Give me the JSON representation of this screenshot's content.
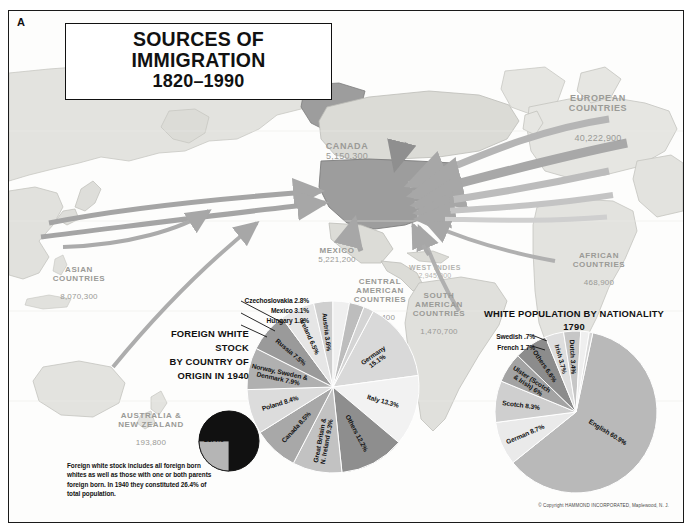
{
  "plate": {
    "letter": "A"
  },
  "title": {
    "line1": "SOURCES OF IMMIGRATION",
    "line2": "1820–1990"
  },
  "copyright": "© Copyright HAMMOND INCORPORATED, Maplewood, N. J.",
  "map_labels": [
    {
      "name": "canada",
      "label": "CANADA",
      "value": "5,150,300"
    },
    {
      "name": "mexico",
      "label": "MEXICO",
      "value": "5,221,200"
    },
    {
      "name": "west-indies",
      "label": "WEST INDIES",
      "value": "2,945,000"
    },
    {
      "name": "central-america",
      "label": "CENTRAL\nAMERICAN\nCOUNTRIES",
      "value": "867,400"
    },
    {
      "name": "south-america",
      "label": "SOUTH\nAMERICAN\nCOUNTRIES",
      "value": "1,470,700"
    },
    {
      "name": "europe",
      "label": "EUROPEAN\nCOUNTRIES",
      "value": "40,222,900"
    },
    {
      "name": "africa",
      "label": "AFRICAN\nCOUNTRIES",
      "value": "468,900"
    },
    {
      "name": "asia",
      "label": "ASIAN\nCOUNTRIES",
      "value": "8,070,300"
    },
    {
      "name": "australia-nz",
      "label": "AUSTRALIA &\nNEW ZEALAND",
      "value": "193,800"
    }
  ],
  "foreign_white_stock": {
    "title_lines": [
      "FOREIGN WHITE STOCK",
      "BY COUNTRY OF",
      "ORIGIN IN 1940"
    ],
    "footnote": "Foreign white stock includes all foreign born whites as well as those with one or both parents foreign born.  In 1940 they constituted 26.4% of total population.",
    "total_share_label": "26.4%"
  },
  "white_population": {
    "title_lines": [
      "WHITE POPULATION BY NATIONALITY",
      "1790"
    ]
  },
  "chart_data": [
    {
      "type": "pie",
      "name": "foreign-white-stock-1940",
      "title": "FOREIGN WHITE STOCK BY COUNTRY OF ORIGIN IN 1940",
      "categories": [
        "Germany",
        "Italy",
        "Others",
        "Great Britain & N. Ireland",
        "Canada",
        "Poland",
        "Norway, Sweden & Denmark",
        "Russia",
        "Ireland",
        "Austria",
        "Mexico",
        "Czechoslovakia",
        "Hungary"
      ],
      "values": [
        15.1,
        13.3,
        12.2,
        9.3,
        8.5,
        8.4,
        7.9,
        7.5,
        6.5,
        3.6,
        3.1,
        2.8,
        1.9
      ],
      "labels": [
        {
          "text": "Germany 15.1%",
          "value": 15.1,
          "placement": "inside"
        },
        {
          "text": "Italy 13.3%",
          "value": 13.3,
          "placement": "inside"
        },
        {
          "text": "Others 12.2%",
          "value": 12.2,
          "placement": "inside"
        },
        {
          "text": "Great Britain &\nN. Ireland 9.3%",
          "value": 9.3,
          "placement": "inside"
        },
        {
          "text": "Canada 8.5%",
          "value": 8.5,
          "placement": "inside"
        },
        {
          "text": "Poland 8.4%",
          "value": 8.4,
          "placement": "inside"
        },
        {
          "text": "Norway, Sweden &\nDenmark 7.9%",
          "value": 7.9,
          "placement": "inside"
        },
        {
          "text": "Russia 7.5%",
          "value": 7.5,
          "placement": "inside"
        },
        {
          "text": "Ireland 6.5%",
          "value": 6.5,
          "placement": "inside"
        },
        {
          "text": "Austria 3.6%",
          "value": 3.6,
          "placement": "inside"
        },
        {
          "text": "Mexico 3.1%",
          "value": 3.1,
          "placement": "outside"
        },
        {
          "text": "Czechoslovakia 2.8%",
          "value": 2.8,
          "placement": "outside"
        },
        {
          "text": "Hungary 1.9%",
          "value": 1.9,
          "placement": "outside"
        }
      ]
    },
    {
      "type": "pie",
      "name": "white-population-1790",
      "title": "WHITE POPULATION BY NATIONALITY 1790",
      "categories": [
        "English",
        "German",
        "Scotch",
        "Ulster (Scotch & Irish)",
        "Others",
        "Irish",
        "Dutch",
        "French",
        "Swedish"
      ],
      "values": [
        60.9,
        8.7,
        8.3,
        6.0,
        6.6,
        3.7,
        3.4,
        1.7,
        0.7
      ],
      "labels": [
        {
          "text": "English 60.9%",
          "value": 60.9,
          "placement": "inside"
        },
        {
          "text": "German 8.7%",
          "value": 8.7,
          "placement": "inside"
        },
        {
          "text": "Scotch 8.3%",
          "value": 8.3,
          "placement": "inside"
        },
        {
          "text": "Ulster (Scotch\n& Irish) 6%",
          "value": 6.0,
          "placement": "inside"
        },
        {
          "text": "Others 6.6%",
          "value": 6.6,
          "placement": "inside"
        },
        {
          "text": "Irish 3.7%",
          "value": 3.7,
          "placement": "inside"
        },
        {
          "text": "Dutch 3.4%",
          "value": 3.4,
          "placement": "inside"
        },
        {
          "text": "French 1.7%",
          "value": 1.7,
          "placement": "outside"
        },
        {
          "text": "Swedish .7%",
          "value": 0.7,
          "placement": "outside"
        }
      ]
    },
    {
      "type": "pie",
      "name": "total-population-share-1940",
      "title": "Foreign white stock share of total population 1940",
      "categories": [
        "Foreign white stock",
        "Remainder"
      ],
      "values": [
        26.4,
        73.6
      ],
      "labels": [
        {
          "text": "26.4%",
          "value": 26.4,
          "placement": "inside"
        }
      ]
    }
  ]
}
